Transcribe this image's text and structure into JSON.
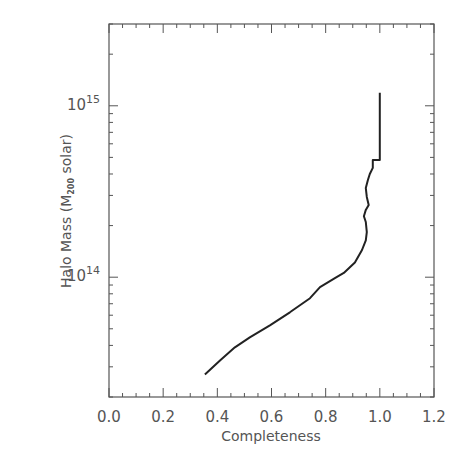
{
  "chart_data": {
    "type": "line",
    "title": "",
    "xlabel": "Completeness",
    "ylabel": "Halo Mass (M200 solar)",
    "ylabel_parts": {
      "pre": "Halo Mass (M",
      "sub": "200",
      "post": " solar)"
    },
    "xlim": [
      0.0,
      1.2
    ],
    "ylim": [
      20000000000000.0,
      3000000000000000.0
    ],
    "yscale": "log",
    "grid": false,
    "legend": null,
    "x_ticks": [
      0.0,
      0.2,
      0.4,
      0.6,
      0.8,
      1.0,
      1.2
    ],
    "x_tick_labels": [
      "0.0",
      "0.2",
      "0.4",
      "0.6",
      "0.8",
      "1.0",
      "1.2"
    ],
    "y_ticks": [
      100000000000000.0,
      1000000000000000.0
    ],
    "y_tick_labels": [
      {
        "base": "10",
        "exp": "14"
      },
      {
        "base": "10",
        "exp": "15"
      }
    ],
    "series": [
      {
        "name": "completeness",
        "color": "#222222",
        "x": [
          0.354,
          0.41,
          0.465,
          0.52,
          0.594,
          0.668,
          0.742,
          0.779,
          0.834,
          0.867,
          0.908,
          0.934,
          0.948,
          0.952,
          0.948,
          0.941,
          0.948,
          0.959,
          0.952,
          0.948,
          0.956,
          0.963,
          0.974,
          0.974,
          1.0,
          1.0
        ],
        "y": [
          27100000000000.0,
          32700000000000.0,
          39000000000000.0,
          44600000000000.0,
          52400000000000.0,
          62400000000000.0,
          75400000000000.0,
          87500000000000.0,
          98700000000000.0,
          106000000000000.0,
          122000000000000.0,
          144000000000000.0,
          164000000000000.0,
          183000000000000.0,
          210000000000000.0,
          227000000000000.0,
          247000000000000.0,
          264000000000000.0,
          294000000000000.0,
          331000000000000.0,
          369000000000000.0,
          400000000000000.0,
          434000000000000.0,
          483000000000000.0,
          483000000000000.0,
          1190000000000000.0
        ]
      }
    ]
  },
  "colors": {
    "axis": "#555555",
    "line": "#222222",
    "background": "#ffffff"
  }
}
